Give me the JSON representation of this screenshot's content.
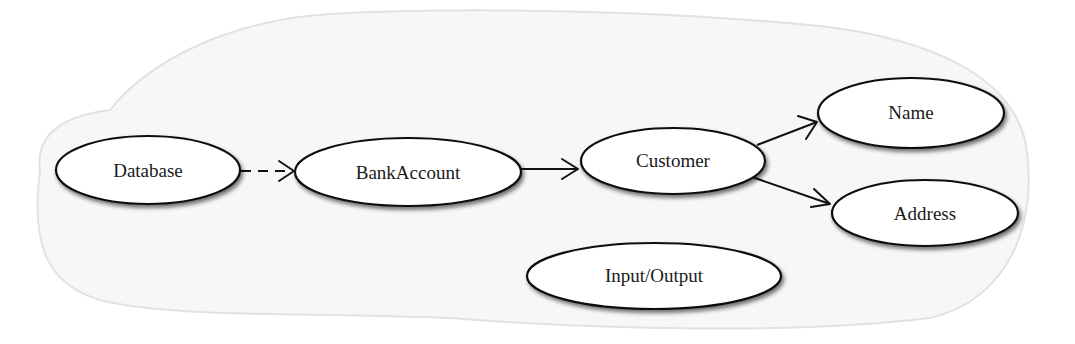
{
  "diagram": {
    "type": "class-dependency-graph",
    "colors": {
      "background": "#ffffff",
      "cloud_fill": "#f7f7f7",
      "cloud_stroke": "#e2e2e2",
      "node_fill": "#ffffff",
      "node_stroke": "#111111",
      "edge": "#111111",
      "text": "#1a1a1a"
    },
    "nodes": [
      {
        "id": "database",
        "label": "Database",
        "cx": 148,
        "cy": 170,
        "rx": 92,
        "ry": 34
      },
      {
        "id": "bankaccount",
        "label": "BankAccount",
        "cx": 408,
        "cy": 172,
        "rx": 113,
        "ry": 34
      },
      {
        "id": "customer",
        "label": "Customer",
        "cx": 673,
        "cy": 161,
        "rx": 92,
        "ry": 33
      },
      {
        "id": "name",
        "label": "Name",
        "cx": 911,
        "cy": 113,
        "rx": 93,
        "ry": 35
      },
      {
        "id": "address",
        "label": "Address",
        "cx": 925,
        "cy": 213,
        "rx": 93,
        "ry": 33
      },
      {
        "id": "inputoutput",
        "label": "Input/Output",
        "cx": 654,
        "cy": 276,
        "rx": 127,
        "ry": 33
      }
    ],
    "edges": [
      {
        "from": "Database",
        "to": "BankAccount",
        "style": "dashed"
      },
      {
        "from": "BankAccount",
        "to": "Customer",
        "style": "solid"
      },
      {
        "from": "Customer",
        "to": "Name",
        "style": "solid"
      },
      {
        "from": "Customer",
        "to": "Address",
        "style": "solid"
      }
    ]
  }
}
